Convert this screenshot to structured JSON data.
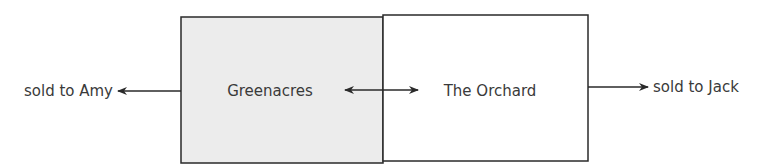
{
  "diagram": {
    "boxes": [
      {
        "id": "greenacres",
        "label": "Greenacres",
        "fill": "#ececec"
      },
      {
        "id": "orchard",
        "label": "The Orchard",
        "fill": "#ffffff"
      }
    ],
    "outputs": {
      "left": "sold to Amy",
      "right": "sold to Jack"
    },
    "colors": {
      "stroke": "#2a2a2a",
      "text": "#3a3a3a"
    }
  }
}
